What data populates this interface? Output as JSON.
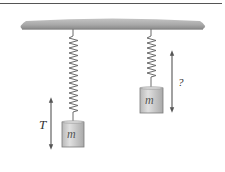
{
  "diagram": {
    "left_system": {
      "mass_label": "m",
      "arrow_label": "T"
    },
    "right_system": {
      "mass_label": "m",
      "arrow_label": "?"
    },
    "colors": {
      "rule": "#555555",
      "ceiling": "#9a9a9a",
      "spring": "#6b6b6b",
      "mass_fill": "#cfcfcf",
      "mass_stroke": "#7a7a7a",
      "arrow": "#555555"
    }
  }
}
